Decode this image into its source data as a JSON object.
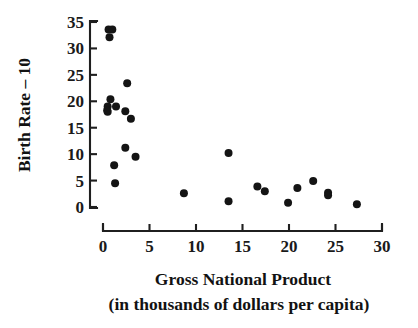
{
  "chart_data": {
    "type": "scatter",
    "title": "",
    "xlabel": "Gross National Product",
    "xlabel_line2": "(in thousands of dollars per capita)",
    "ylabel": "Birth Rate – 10",
    "xlim": [
      0,
      30
    ],
    "ylim": [
      0,
      35
    ],
    "xticks": [
      0,
      5,
      10,
      15,
      20,
      25,
      30
    ],
    "yticks": [
      0,
      5,
      10,
      15,
      20,
      25,
      30,
      35
    ],
    "xtick_labels": [
      "0",
      "5",
      "10",
      "15",
      "20",
      "25",
      "30"
    ],
    "ytick_labels": [
      "0",
      "5",
      "10",
      "15",
      "20",
      "25",
      "30",
      "35"
    ],
    "grid": false,
    "legend": false,
    "marker_color": "#141414",
    "marker_size": 4.0,
    "points": [
      {
        "x": 0.6,
        "y": 33.6
      },
      {
        "x": 1.0,
        "y": 33.6
      },
      {
        "x": 0.7,
        "y": 32.1
      },
      {
        "x": 2.6,
        "y": 23.4
      },
      {
        "x": 0.8,
        "y": 20.4
      },
      {
        "x": 1.4,
        "y": 19.0
      },
      {
        "x": 0.5,
        "y": 19.0
      },
      {
        "x": 0.45,
        "y": 18.3
      },
      {
        "x": 0.5,
        "y": 18.0
      },
      {
        "x": 2.4,
        "y": 18.1
      },
      {
        "x": 3.0,
        "y": 16.7
      },
      {
        "x": 2.4,
        "y": 11.2
      },
      {
        "x": 3.5,
        "y": 9.5
      },
      {
        "x": 13.5,
        "y": 10.2
      },
      {
        "x": 1.2,
        "y": 7.9
      },
      {
        "x": 1.3,
        "y": 4.5
      },
      {
        "x": 22.6,
        "y": 4.9
      },
      {
        "x": 16.6,
        "y": 3.9
      },
      {
        "x": 17.4,
        "y": 3.0
      },
      {
        "x": 20.9,
        "y": 3.6
      },
      {
        "x": 24.2,
        "y": 2.7
      },
      {
        "x": 24.2,
        "y": 2.2
      },
      {
        "x": 8.7,
        "y": 2.6
      },
      {
        "x": 13.5,
        "y": 1.1
      },
      {
        "x": 19.9,
        "y": 0.8
      },
      {
        "x": 27.3,
        "y": 0.5
      }
    ]
  },
  "axes": {
    "x_axis_name": "x-axis",
    "y_axis_name": "y-axis"
  }
}
